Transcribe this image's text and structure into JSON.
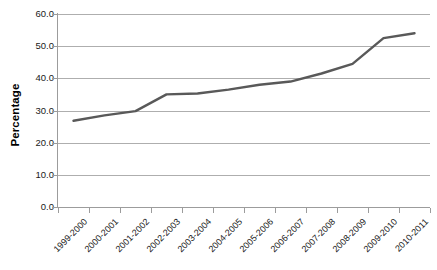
{
  "chart_data": {
    "type": "line",
    "title": "",
    "xlabel": "",
    "ylabel": "Percentage",
    "categories": [
      "1999-2000",
      "2000-2001",
      "2001-2002",
      "2002-2003",
      "2003-2004",
      "2004-2005",
      "2005-2006",
      "2006-2007",
      "2007-2008",
      "2008-2009",
      "2009-2010",
      "2010-2011"
    ],
    "values": [
      26.8,
      28.5,
      29.8,
      35.0,
      35.3,
      36.5,
      38.0,
      39.0,
      41.5,
      44.5,
      52.5,
      54.0
    ],
    "ylim": [
      0.0,
      60.0
    ],
    "ytick_values": [
      0.0,
      10.0,
      20.0,
      30.0,
      40.0,
      50.0,
      60.0
    ],
    "ytick_labels": [
      "0.0",
      "10.0",
      "20.0",
      "30.0",
      "40.0",
      "50.0",
      "60.0"
    ],
    "grid": true,
    "legend": "none",
    "series_color": "#595959",
    "gridline_color": "#aeaeae",
    "axis_color": "#9c9c9c",
    "background_color": "#ffffff",
    "x_label_rotation": -45
  }
}
